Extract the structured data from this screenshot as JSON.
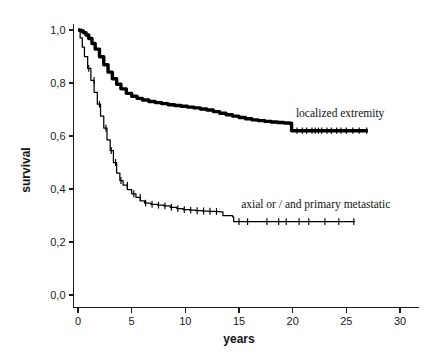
{
  "chart_data": {
    "type": "line",
    "title": "",
    "subtitle": "",
    "xlabel": "years",
    "ylabel": "survival",
    "xlim": [
      0,
      31
    ],
    "ylim": [
      0.0,
      1.0
    ],
    "xticks": [
      0,
      5,
      10,
      15,
      20,
      25,
      30
    ],
    "xticklabels": [
      "0",
      "5",
      "10",
      "15",
      "20",
      "25",
      "30"
    ],
    "yticks": [
      0.0,
      0.2,
      0.4,
      0.6,
      0.8,
      1.0
    ],
    "yticklabels": [
      "0,0",
      "0,2",
      "0,4",
      "0,6",
      "0,8",
      "1,0"
    ],
    "grid": false,
    "legend_position": "inline-annotations",
    "decimal_separator": ",",
    "series": [
      {
        "name": "localized extremity",
        "label": "localized extremity",
        "label_x": 20.3,
        "label_y": 0.672,
        "line_style": "thick-step",
        "color": "#000000",
        "x": [
          0,
          0.15,
          0.3,
          0.5,
          0.75,
          1.0,
          1.3,
          1.6,
          2.0,
          2.4,
          2.8,
          3.2,
          3.6,
          4.0,
          4.5,
          5.0,
          5.5,
          6.0,
          6.6,
          7.2,
          7.8,
          8.4,
          9.0,
          9.6,
          10.2,
          10.8,
          11.4,
          12.0,
          12.6,
          13.2,
          13.8,
          14.4,
          15.0,
          15.6,
          16.2,
          16.8,
          17.4,
          18.0,
          18.6,
          19.2,
          19.7,
          19.9,
          21.0,
          22.5,
          24.0,
          25.5,
          27.0
        ],
        "y": [
          1.0,
          0.999,
          0.996,
          0.99,
          0.981,
          0.968,
          0.949,
          0.928,
          0.899,
          0.869,
          0.841,
          0.816,
          0.795,
          0.778,
          0.761,
          0.75,
          0.742,
          0.736,
          0.73,
          0.726,
          0.722,
          0.718,
          0.715,
          0.712,
          0.709,
          0.706,
          0.702,
          0.698,
          0.692,
          0.686,
          0.68,
          0.675,
          0.67,
          0.665,
          0.661,
          0.658,
          0.655,
          0.653,
          0.651,
          0.649,
          0.648,
          0.62,
          0.62,
          0.62,
          0.62,
          0.62,
          0.62
        ],
        "censor_x": [
          20.4,
          20.9,
          21.3,
          21.8,
          22.1,
          22.4,
          22.7,
          23.2,
          23.6,
          24.1,
          24.5,
          25.0,
          25.6,
          26.2,
          26.9
        ],
        "censor_y": 0.62
      },
      {
        "name": "axial or / and primary metastatic",
        "label": "axial or / and primary metastatic",
        "label_x": 15.2,
        "label_y": 0.33,
        "line_style": "thin-step",
        "color": "#000000",
        "x": [
          0,
          0.2,
          0.4,
          0.6,
          0.9,
          1.2,
          1.5,
          1.8,
          2.1,
          2.4,
          2.7,
          3.0,
          3.3,
          3.6,
          3.9,
          4.2,
          4.6,
          5.0,
          5.4,
          5.8,
          6.2,
          6.8,
          7.4,
          8.0,
          8.6,
          9.2,
          9.8,
          10.4,
          11.0,
          11.6,
          12.2,
          12.8,
          13.2,
          13.5,
          14.2,
          14.4,
          14.5,
          15.5,
          17.5,
          20.0,
          22.5,
          25.8
        ],
        "y": [
          1.0,
          0.97,
          0.935,
          0.9,
          0.855,
          0.81,
          0.765,
          0.72,
          0.675,
          0.63,
          0.585,
          0.545,
          0.5,
          0.46,
          0.432,
          0.415,
          0.398,
          0.382,
          0.368,
          0.355,
          0.347,
          0.342,
          0.339,
          0.336,
          0.331,
          0.326,
          0.322,
          0.32,
          0.318,
          0.317,
          0.316,
          0.315,
          0.314,
          0.3,
          0.3,
          0.295,
          0.277,
          0.277,
          0.277,
          0.277,
          0.277,
          0.277
        ],
        "censor_x": [
          1.0,
          1.5,
          2.0,
          2.6,
          3.1,
          3.5,
          4.0,
          4.6,
          5.2,
          5.8,
          6.3,
          6.9,
          7.5,
          8.1,
          8.7,
          9.3,
          9.9,
          10.5,
          11.1,
          11.7,
          12.3,
          12.9,
          15.0,
          15.8,
          17.6,
          18.7,
          19.4,
          20.6,
          21.5,
          23.0,
          24.3,
          25.7
        ],
        "censor_y": null
      }
    ]
  },
  "axes": {
    "y_axis_title": "survival",
    "x_axis_title": "years"
  }
}
